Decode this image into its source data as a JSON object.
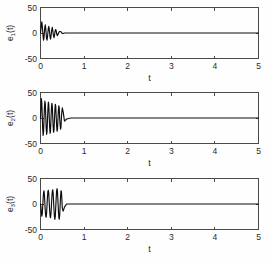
{
  "figure": {
    "title": "",
    "background_color": "#fefefe",
    "line_color": "#0d0d0d",
    "axis_color": "#4a4a4a",
    "width": 271,
    "height": 261
  },
  "chart_data": [
    {
      "type": "line",
      "title": "",
      "xlabel": "t",
      "ylabel": "e_1(t)",
      "ylabel_base": "e",
      "ylabel_sub": "1",
      "ylabel_tail": "(t)",
      "xlim": [
        0,
        5
      ],
      "ylim": [
        -50,
        50
      ],
      "xticks": [
        0,
        1,
        2,
        3,
        4,
        5
      ],
      "xticklabels": [
        "0",
        "1",
        "2",
        "3",
        "4",
        "5"
      ],
      "yticks": [
        -50,
        0,
        50
      ],
      "yticklabels": [
        "-50",
        "0",
        "50"
      ],
      "grid": false,
      "legend": null,
      "series": [
        {
          "name": "e1",
          "x": [
            0.0,
            0.01,
            0.02,
            0.03,
            0.04,
            0.05,
            0.06,
            0.07,
            0.08,
            0.09,
            0.1,
            0.11,
            0.12,
            0.13,
            0.14,
            0.15,
            0.16,
            0.17,
            0.18,
            0.19,
            0.2,
            0.21,
            0.22,
            0.23,
            0.24,
            0.25,
            0.26,
            0.27,
            0.28,
            0.29,
            0.3,
            0.31,
            0.32,
            0.33,
            0.34,
            0.35,
            0.36,
            0.37,
            0.38,
            0.39,
            0.4,
            0.42,
            0.44,
            0.46,
            0.48,
            0.5,
            0.52,
            0.55,
            0.6,
            0.7,
            0.85,
            1.0,
            1.2,
            1.5,
            1.8,
            2.1,
            2.4,
            2.8,
            3.2,
            3.6,
            4.0,
            4.4,
            4.8,
            5.0
          ],
          "y": [
            0,
            8,
            17,
            22,
            15,
            4,
            -7,
            -14,
            -9,
            2,
            12,
            16,
            9,
            -2,
            -11,
            -14,
            -8,
            1,
            9,
            13,
            8,
            0,
            -8,
            -12,
            -7,
            1,
            7,
            11,
            6,
            -1,
            -6,
            -9,
            -5,
            1,
            5,
            7,
            4,
            -1,
            -4,
            -5,
            -3,
            1,
            3,
            3,
            1,
            -1,
            -1,
            0,
            0,
            0,
            0,
            0,
            0,
            0,
            0,
            0,
            0,
            0,
            0,
            0,
            0,
            0,
            0,
            0
          ]
        }
      ]
    },
    {
      "type": "line",
      "title": "",
      "xlabel": "t",
      "ylabel": "e_2(t)",
      "ylabel_base": "e",
      "ylabel_sub": "2",
      "ylabel_tail": "(t)",
      "xlim": [
        0,
        5
      ],
      "ylim": [
        -50,
        50
      ],
      "xticks": [
        0,
        1,
        2,
        3,
        4,
        5
      ],
      "xticklabels": [
        "0",
        "1",
        "2",
        "3",
        "4",
        "5"
      ],
      "yticks": [
        -50,
        0,
        50
      ],
      "yticklabels": [
        "-50",
        "0",
        "50"
      ],
      "grid": false,
      "legend": null,
      "series": [
        {
          "name": "e2",
          "x": [
            0.0,
            0.01,
            0.02,
            0.03,
            0.04,
            0.05,
            0.06,
            0.07,
            0.08,
            0.09,
            0.1,
            0.11,
            0.12,
            0.13,
            0.14,
            0.15,
            0.16,
            0.17,
            0.18,
            0.19,
            0.2,
            0.21,
            0.22,
            0.23,
            0.24,
            0.25,
            0.26,
            0.27,
            0.28,
            0.29,
            0.3,
            0.31,
            0.32,
            0.33,
            0.34,
            0.35,
            0.36,
            0.37,
            0.38,
            0.39,
            0.4,
            0.41,
            0.42,
            0.43,
            0.44,
            0.45,
            0.46,
            0.47,
            0.48,
            0.49,
            0.5,
            0.52,
            0.55,
            0.6,
            0.7,
            0.85,
            1.0,
            1.2,
            1.5,
            1.8,
            2.1,
            2.4,
            2.8,
            3.2,
            3.6,
            4.0,
            4.4,
            4.8,
            5.0
          ],
          "y": [
            0,
            22,
            38,
            30,
            6,
            -20,
            -34,
            -28,
            -4,
            20,
            33,
            28,
            5,
            -19,
            -32,
            -27,
            -4,
            18,
            31,
            27,
            3,
            -18,
            -30,
            -26,
            -3,
            17,
            29,
            25,
            3,
            -16,
            -28,
            -24,
            -2,
            16,
            27,
            23,
            2,
            -15,
            -26,
            -22,
            -2,
            14,
            24,
            20,
            -2,
            -13,
            -22,
            -18,
            2,
            12,
            20,
            12,
            -6,
            -2,
            0,
            0,
            0,
            0,
            0,
            0,
            0,
            0,
            0,
            0,
            0,
            0,
            0,
            0,
            0
          ]
        }
      ]
    },
    {
      "type": "line",
      "title": "",
      "xlabel": "t",
      "ylabel": "e_3(t)",
      "ylabel_base": "e",
      "ylabel_sub": "3",
      "ylabel_tail": "(t)",
      "xlim": [
        0,
        5
      ],
      "ylim": [
        -50,
        50
      ],
      "xticks": [
        0,
        1,
        2,
        3,
        4,
        5
      ],
      "xticklabels": [
        "0",
        "1",
        "2",
        "3",
        "4",
        "5"
      ],
      "yticks": [
        -50,
        0,
        50
      ],
      "yticklabels": [
        "-50",
        "0",
        "50"
      ],
      "grid": false,
      "legend": null,
      "series": [
        {
          "name": "e3",
          "x": [
            0.0,
            0.01,
            0.02,
            0.03,
            0.04,
            0.05,
            0.06,
            0.07,
            0.08,
            0.09,
            0.1,
            0.11,
            0.12,
            0.13,
            0.14,
            0.15,
            0.16,
            0.17,
            0.18,
            0.19,
            0.2,
            0.21,
            0.22,
            0.23,
            0.24,
            0.25,
            0.26,
            0.27,
            0.28,
            0.29,
            0.3,
            0.31,
            0.32,
            0.33,
            0.34,
            0.35,
            0.36,
            0.37,
            0.38,
            0.39,
            0.4,
            0.41,
            0.42,
            0.43,
            0.44,
            0.45,
            0.46,
            0.47,
            0.48,
            0.49,
            0.5,
            0.52,
            0.55,
            0.6,
            0.7,
            0.85,
            1.0,
            1.2,
            1.5,
            1.8,
            2.1,
            2.4,
            2.8,
            3.2,
            3.6,
            4.0,
            4.4,
            4.8,
            5.0
          ],
          "y": [
            0,
            -6,
            -16,
            -24,
            -20,
            -6,
            10,
            22,
            26,
            18,
            2,
            -14,
            -24,
            -26,
            -18,
            -2,
            14,
            25,
            27,
            19,
            3,
            -13,
            -24,
            -27,
            -20,
            -4,
            12,
            24,
            28,
            22,
            5,
            -12,
            -25,
            -30,
            -24,
            -6,
            12,
            26,
            30,
            24,
            6,
            -12,
            -26,
            -30,
            -22,
            -4,
            14,
            26,
            24,
            10,
            -8,
            -14,
            -6,
            0,
            0,
            0,
            0,
            0,
            0,
            0,
            0,
            0,
            0,
            0,
            0,
            0,
            0,
            0,
            0
          ]
        }
      ]
    }
  ]
}
